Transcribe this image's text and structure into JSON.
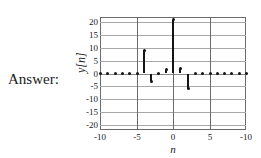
{
  "answer": {
    "label": "Answer:"
  },
  "chart_data": {
    "type": "bar",
    "title": "",
    "subtitle": "",
    "xlabel": "n",
    "ylabel": "y[n]",
    "xlim": [
      -10,
      10
    ],
    "ylim": [
      -22,
      22
    ],
    "grid": true,
    "legend": null,
    "xticks": [
      -10,
      -5,
      0,
      5,
      10
    ],
    "xtick_labels": [
      "-10",
      "-5",
      "0",
      "5",
      "-10"
    ],
    "yticks": [
      20,
      15,
      10,
      5,
      0,
      -5,
      -10,
      -15,
      -20
    ],
    "ytick_labels": [
      "20",
      "15",
      "10",
      "5",
      "0",
      "-5",
      "-10",
      "-15",
      "-20"
    ],
    "x": [
      -10,
      -9,
      -8,
      -7,
      -6,
      -5,
      -4,
      -3,
      -2,
      -1,
      0,
      1,
      2,
      3,
      4,
      5,
      6,
      7,
      8,
      9,
      10
    ],
    "values": [
      0,
      0,
      0,
      0,
      0,
      0,
      9,
      -3,
      0,
      1.5,
      21,
      2,
      -6,
      0,
      0,
      0,
      0,
      0,
      0,
      0,
      0
    ],
    "series": [
      {
        "name": "y[n]",
        "values": [
          0,
          0,
          0,
          0,
          0,
          0,
          9,
          -3,
          0,
          1.5,
          21,
          2,
          -6,
          0,
          0,
          0,
          0,
          0,
          0,
          0,
          0
        ]
      }
    ],
    "categories": [
      "-10",
      "-9",
      "-8",
      "-7",
      "-6",
      "-5",
      "-4",
      "-3",
      "-2",
      "-1",
      "0",
      "1",
      "2",
      "3",
      "4",
      "5",
      "6",
      "7",
      "8",
      "9",
      "10"
    ],
    "colors": {
      "stem": "#141414",
      "grid": "#a8a8a8",
      "axis": "#6b6b6b",
      "background": "#ffffff",
      "text": "#1a1a1a"
    }
  }
}
